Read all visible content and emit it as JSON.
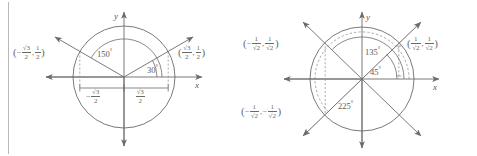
{
  "figure": {
    "stroke_color": "#6b6b6b",
    "text_color": "#5a5a5a",
    "background": "#ffffff",
    "border_color": "#b9b9b9"
  },
  "panels": [
    {
      "id": "left-panel",
      "axis_x_label": "x",
      "axis_y_label": "y",
      "angles": [
        {
          "name": "angle-150",
          "text": "150",
          "degree_symbol": "°"
        },
        {
          "name": "angle-30",
          "text": "30",
          "degree_symbol": "°"
        }
      ],
      "point_labels": [
        {
          "name": "point-label-150",
          "open": "(",
          "sign1": "−",
          "num1": "√3",
          "den1": "2",
          "comma": ",",
          "sign2": "",
          "num2": "1",
          "den2": "2",
          "close": ")"
        },
        {
          "name": "point-label-30",
          "open": "(",
          "sign1": "",
          "num1": "√3",
          "den1": "2",
          "comma": ",",
          "sign2": "",
          "num2": "1",
          "den2": "2",
          "close": ")"
        }
      ],
      "measure_labels": [
        {
          "name": "measure-neg-root3-over-2",
          "sign": "−",
          "num": "√3",
          "den": "2"
        },
        {
          "name": "measure-root3-over-2",
          "sign": "",
          "num": "√3",
          "den": "2"
        }
      ]
    },
    {
      "id": "right-panel",
      "axis_x_label": "x",
      "axis_y_label": "y",
      "angles": [
        {
          "name": "angle-135",
          "text": "135",
          "degree_symbol": "°"
        },
        {
          "name": "angle-45",
          "text": "45",
          "degree_symbol": "°"
        },
        {
          "name": "angle-225",
          "text": "225",
          "degree_symbol": "°"
        }
      ],
      "point_labels": [
        {
          "name": "point-label-135",
          "open": "(",
          "sign1": "−",
          "num1": "1",
          "den1": "√2",
          "comma": ",",
          "sign2": "",
          "num2": "1",
          "den2": "√2",
          "close": ")"
        },
        {
          "name": "point-label-45",
          "open": "(",
          "sign1": "",
          "num1": "1",
          "den1": "√2",
          "comma": ",",
          "sign2": "",
          "num2": "1",
          "den2": "√2",
          "close": ")"
        },
        {
          "name": "point-label-225",
          "open": "(",
          "sign1": "−",
          "num1": "1",
          "den1": "√2",
          "comma": ",",
          "sign2": "−",
          "num2": "1",
          "den2": "√2",
          "close": ")"
        }
      ]
    }
  ]
}
